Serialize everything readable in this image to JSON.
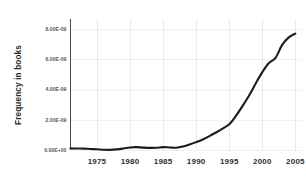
{
  "chart_data": {
    "type": "line",
    "title": "",
    "subtitle": "",
    "xlabel": "",
    "ylabel": "Frequency in books",
    "xlim": [
      1971,
      2006
    ],
    "ylim": [
      0,
      8.6e-09
    ],
    "grid": true,
    "legend": false,
    "legend_position": "none",
    "x_ticks": [
      1975,
      1980,
      1985,
      1990,
      1995,
      2000,
      2005
    ],
    "x_tick_labels": [
      "1975",
      "1980",
      "1985",
      "1990",
      "1995",
      "2000",
      "2005"
    ],
    "y_ticks": [
      0,
      2e-09,
      4e-09,
      6e-09,
      8e-09
    ],
    "y_tick_labels": [
      "0.00E+00",
      "2.00E-09",
      "4.00E-09",
      "6.00E-09",
      "8.00E-09"
    ],
    "series": [
      {
        "name": "Frequency in books",
        "color": "#1c1c1c",
        "line_width": 2.1,
        "x": [
          1971,
          1972,
          1973,
          1974,
          1975,
          1976,
          1977,
          1978,
          1979,
          1980,
          1981,
          1982,
          1983,
          1984,
          1985,
          1986,
          1987,
          1988,
          1989,
          1990,
          1991,
          1992,
          1993,
          1994,
          1995,
          1996,
          1997,
          1998,
          1999,
          2000,
          2001,
          2002,
          2003,
          2004,
          2005
        ],
        "y": [
          1.1e-10,
          1e-10,
          9e-11,
          7e-11,
          5e-11,
          2e-11,
          1e-11,
          4e-11,
          1e-10,
          1.7e-10,
          1.9e-10,
          1.6e-10,
          1.4e-10,
          1.5e-10,
          1.9e-10,
          1.7e-10,
          1.5e-10,
          2.3e-10,
          3.6e-10,
          5.2e-10,
          7e-10,
          9.2e-10,
          1.16e-09,
          1.42e-09,
          1.7e-09,
          2.25e-09,
          2.9e-09,
          3.6e-09,
          4.4e-09,
          5.15e-09,
          5.75e-09,
          6.1e-09,
          6.95e-09,
          7.45e-09,
          7.7e-09
        ]
      }
    ]
  },
  "axis": {
    "y_title": "Frequency in books"
  }
}
